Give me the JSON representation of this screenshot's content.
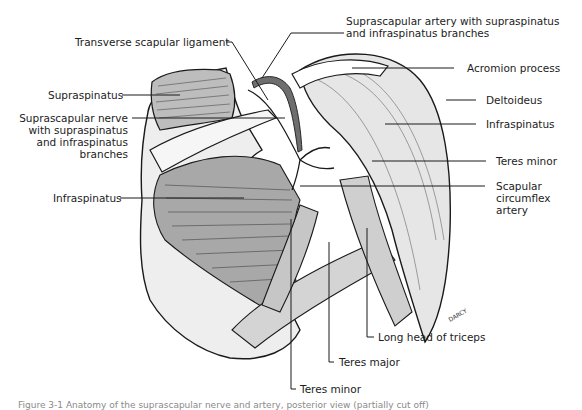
{
  "figure": {
    "type": "anatomical-illustration",
    "labels": {
      "suprascapular_artery": [
        "Suprascapular artery with supraspinatus",
        "and infraspinatus branches"
      ],
      "transverse_scapular_ligament": "Transverse scapular ligament",
      "acromion_process": "Acromion process",
      "supraspinatus": "Supraspinatus",
      "deltoideus": "Deltoideus",
      "suprascapular_nerve": [
        "Suprascapular nerve",
        "with supraspinatus",
        "and infraspinatus",
        "branches"
      ],
      "infraspinatus_right": "Infraspinatus",
      "teres_minor_right": "Teres minor",
      "scapular_circumflex_artery": [
        "Scapular",
        "circumflex",
        "artery"
      ],
      "infraspinatus_left": "Infraspinatus",
      "long_head_triceps": "Long head of triceps",
      "teres_major": "Teres major",
      "teres_minor_bottom": "Teres minor"
    },
    "caption": "Figure 3-1  Anatomy of the suprascapular nerve and artery, posterior view (partially cut off)"
  },
  "colors": {
    "ink": "#1a1a1a",
    "muscle_shade": "#8c8c8c",
    "light_fill": "#d9d9d9",
    "artery_fill": "#6e6e6e"
  }
}
